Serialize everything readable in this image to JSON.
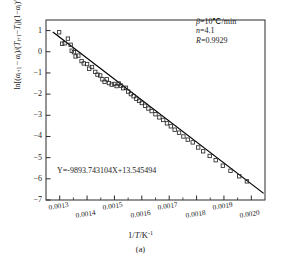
{
  "figure": {
    "caption": "(a)",
    "x_axis_title_prefix": "1/",
    "x_axis_title_var": "T",
    "x_axis_title_unit": "/K",
    "x_axis_title_exp": "-1",
    "equation": "Y=-9893.743104X+13.545494",
    "annotations": [
      {
        "symbol": "β",
        "rest": "=10℃/min"
      },
      {
        "symbol": "n",
        "rest": "=4.1"
      },
      {
        "symbol": "R",
        "rest": "=0.9929"
      }
    ]
  },
  "chart_data": {
    "type": "scatter",
    "title": "",
    "subtitle": "(a)",
    "xlabel": "1/T/K⁻¹",
    "ylabel": "ln[(αi+1−αi)/(Ti+1−Ti)(1−αi)ⁿ]",
    "xlim": [
      0.00125,
      0.00205
    ],
    "ylim": [
      -7,
      1.5
    ],
    "xticks": [
      0.0013,
      0.0014,
      0.0015,
      0.0016,
      0.0017,
      0.0018,
      0.0019,
      0.002
    ],
    "xtick_labels": [
      "0.0013",
      "0.0014",
      "0.0015",
      "0.0016",
      "0.0017",
      "0.0018",
      "0.0019",
      "0.0020"
    ],
    "yticks": [
      1,
      0,
      -1,
      -2,
      -3,
      -4,
      -5,
      -6,
      -7
    ],
    "ytick_labels": [
      "1",
      "0",
      "-1",
      "-2",
      "-3",
      "-4",
      "-5",
      "-6",
      "-7"
    ],
    "grid": false,
    "legend": "none",
    "marker": "open-square",
    "fit_line": {
      "slope": -9893.743104,
      "intercept": 13.545494,
      "equation": "Y=-9893.743104X+13.545494",
      "x_start": 0.001275,
      "x_end": 0.002045
    },
    "stats": {
      "beta": "10℃/min",
      "n": 4.1,
      "R": 0.9929
    },
    "points": [
      [
        0.001298,
        0.92
      ],
      [
        0.001309,
        0.38
      ],
      [
        0.001318,
        0.4
      ],
      [
        0.00133,
        0.62
      ],
      [
        0.00134,
        0.33
      ],
      [
        0.001344,
        0.05
      ],
      [
        0.001352,
        -0.02
      ],
      [
        0.001358,
        -0.22
      ],
      [
        0.001368,
        -0.18
      ],
      [
        0.00138,
        -0.44
      ],
      [
        0.001388,
        -0.55
      ],
      [
        0.0014,
        -0.58
      ],
      [
        0.001408,
        -0.8
      ],
      [
        0.001418,
        -0.72
      ],
      [
        0.00143,
        -0.95
      ],
      [
        0.001438,
        -1.08
      ],
      [
        0.001448,
        -1.12
      ],
      [
        0.001456,
        -1.3
      ],
      [
        0.001464,
        -1.42
      ],
      [
        0.001472,
        -1.3
      ],
      [
        0.00148,
        -1.48
      ],
      [
        0.00149,
        -1.55
      ],
      [
        0.0015,
        -1.52
      ],
      [
        0.001508,
        -1.62
      ],
      [
        0.001516,
        -1.5
      ],
      [
        0.001524,
        -1.6
      ],
      [
        0.001532,
        -1.72
      ],
      [
        0.001542,
        -1.7
      ],
      [
        0.00155,
        -1.88
      ],
      [
        0.00156,
        -2.0
      ],
      [
        0.00157,
        -2.1
      ],
      [
        0.00158,
        -2.22
      ],
      [
        0.00159,
        -2.32
      ],
      [
        0.0016,
        -2.42
      ],
      [
        0.001612,
        -2.55
      ],
      [
        0.001624,
        -2.68
      ],
      [
        0.001636,
        -2.8
      ],
      [
        0.00165,
        -2.95
      ],
      [
        0.001664,
        -3.1
      ],
      [
        0.001678,
        -3.22
      ],
      [
        0.001692,
        -3.38
      ],
      [
        0.001706,
        -3.52
      ],
      [
        0.00172,
        -3.68
      ],
      [
        0.001736,
        -3.82
      ],
      [
        0.001752,
        -4.0
      ],
      [
        0.001768,
        -4.15
      ],
      [
        0.001786,
        -4.28
      ],
      [
        0.001806,
        -4.52
      ],
      [
        0.001824,
        -4.7
      ],
      [
        0.001848,
        -4.92
      ],
      [
        0.00187,
        -5.12
      ],
      [
        0.001896,
        -5.38
      ],
      [
        0.001924,
        -5.62
      ],
      [
        0.001956,
        -5.88
      ],
      [
        0.001984,
        -6.12
      ]
    ]
  }
}
